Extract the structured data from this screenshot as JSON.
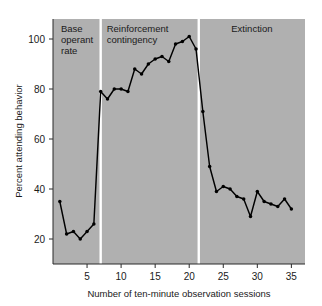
{
  "chart_data": {
    "type": "line",
    "title": "",
    "xlabel": "Number of ten-minute observation sessions",
    "ylabel": "Percent attending behavior",
    "xlim": [
      0,
      37
    ],
    "ylim": [
      10,
      108
    ],
    "xticks": [
      5,
      10,
      15,
      20,
      25,
      30,
      35
    ],
    "yticks": [
      20,
      40,
      60,
      80,
      100
    ],
    "grid": false,
    "legend": "none",
    "background_color": "#b0b0b0",
    "line_color": "#000000",
    "divider_color": "#ffffff",
    "series": [
      {
        "name": "Percent attending behavior",
        "x": [
          1,
          2,
          3,
          4,
          5,
          6,
          7,
          8,
          9,
          10,
          11,
          12,
          13,
          14,
          15,
          16,
          17,
          18,
          19,
          20,
          21,
          22,
          23,
          24,
          25,
          26,
          27,
          28,
          29,
          30,
          31,
          32,
          33,
          34,
          35
        ],
        "values": [
          35,
          22,
          23,
          20,
          23,
          26,
          79,
          76,
          80,
          80,
          79,
          88,
          86,
          90,
          92,
          93,
          91,
          98,
          99,
          101,
          96,
          71,
          49,
          39,
          41,
          40,
          37,
          36,
          29,
          39,
          35,
          34,
          33,
          36,
          32
        ]
      }
    ],
    "phases": [
      {
        "label_line1": "Base",
        "label_line2": "operant",
        "label_line3": "rate",
        "x_start": 0,
        "x_end": 7
      },
      {
        "label_line1": "Reinforcement",
        "label_line2": "contingency",
        "label_line3": "",
        "x_start": 7,
        "x_end": 21.4
      },
      {
        "label_line1": "Extinction",
        "label_line2": "",
        "label_line3": "",
        "x_start": 21.4,
        "x_end": 37
      }
    ]
  }
}
